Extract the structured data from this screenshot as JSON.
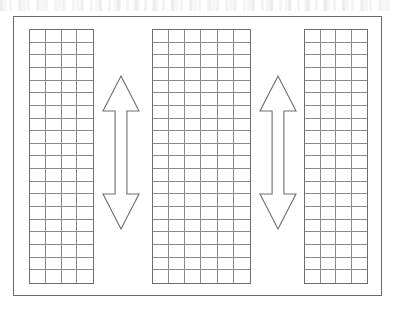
{
  "diagram": {
    "background_color": "#ffffff",
    "frame": {
      "label": "outer-border",
      "x": 13,
      "y": 16,
      "width": 369,
      "height": 280,
      "stroke_color": "#6b6b6b",
      "stroke_width": 1.4
    },
    "grids": [
      {
        "label": "grid-panel-left",
        "x": 28,
        "y": 28,
        "width": 65,
        "height": 255,
        "columns": 4,
        "rows": 20,
        "stroke_color": "#6e6e6e",
        "cell_stroke_color": "#8a8a8a",
        "fill_color": "#ffffff"
      },
      {
        "label": "grid-panel-middle",
        "x": 151,
        "y": 28,
        "width": 99,
        "height": 255,
        "columns": 6,
        "rows": 20,
        "stroke_color": "#6e6e6e",
        "cell_stroke_color": "#8a8a8a",
        "fill_color": "#ffffff"
      },
      {
        "label": "grid-panel-right",
        "x": 303,
        "y": 28,
        "width": 64,
        "height": 255,
        "columns": 4,
        "rows": 20,
        "stroke_color": "#6e6e6e",
        "cell_stroke_color": "#8a8a8a",
        "fill_color": "#ffffff"
      }
    ],
    "arrows": [
      {
        "label": "double-arrow-left",
        "direction": "up-down",
        "x": 101,
        "y": 74,
        "width": 38,
        "height": 155,
        "stroke_color": "#6e6e6e",
        "fill_color": "#ffffff"
      },
      {
        "label": "double-arrow-right",
        "direction": "up-down",
        "x": 258,
        "y": 74,
        "width": 38,
        "height": 155,
        "stroke_color": "#6e6e6e",
        "fill_color": "#ffffff"
      }
    ]
  }
}
